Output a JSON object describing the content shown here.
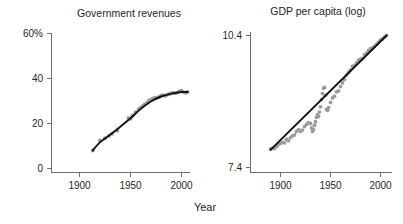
{
  "figure": {
    "width": 403,
    "height": 224,
    "background": "#ffffff",
    "shared_xlabel": "Year",
    "marker_color": "#9c9c9c",
    "trend_color": "#111111",
    "axis_color": "#6e6e6e"
  },
  "chart_data": [
    {
      "type": "scatter",
      "panel": "left",
      "title": "Government revenues",
      "xlabel": "Year",
      "ylabel": "",
      "grid": false,
      "legend": null,
      "xlim": [
        1885,
        2012
      ],
      "ylim": [
        0,
        63
      ],
      "xticks": [
        1900,
        1950,
        2000
      ],
      "xtick_labels": [
        "1900",
        "1950",
        "2000"
      ],
      "yticks": [
        0,
        20,
        40,
        60
      ],
      "ytick_labels": [
        "0",
        "20",
        "40",
        "60%"
      ],
      "series": [
        {
          "name": "Government revenues (% of GDP)",
          "role": "points",
          "color": "#9c9c9c",
          "x": [
            1913,
            1920,
            1925,
            1929,
            1932,
            1937,
            1948,
            1950,
            1952,
            1955,
            1958,
            1960,
            1962,
            1964,
            1966,
            1968,
            1970,
            1972,
            1974,
            1976,
            1978,
            1980,
            1982,
            1984,
            1986,
            1988,
            1990,
            1992,
            1994,
            1996,
            1998,
            2000,
            2002,
            2004,
            2006
          ],
          "y": [
            8.0,
            12.5,
            13.4,
            14.6,
            15.5,
            16.8,
            22.4,
            22.1,
            23.6,
            25.0,
            26.3,
            27.0,
            27.8,
            28.4,
            29.1,
            30.2,
            30.6,
            31.1,
            31.5,
            31.4,
            31.8,
            32.4,
            32.6,
            32.3,
            32.8,
            33.1,
            33.4,
            33.6,
            33.5,
            33.8,
            34.3,
            34.6,
            33.9,
            33.7,
            34.0
          ]
        },
        {
          "name": "Smoothed trend",
          "role": "fit",
          "color": "#111111",
          "x": [
            1913,
            1920,
            1930,
            1940,
            1950,
            1960,
            1970,
            1980,
            1990,
            2000,
            2006
          ],
          "y": [
            8.0,
            11.6,
            15.0,
            18.6,
            22.3,
            26.5,
            29.8,
            32.0,
            33.3,
            34.0,
            34.0
          ]
        }
      ]
    },
    {
      "type": "scatter",
      "panel": "right",
      "title": "GDP per capita (log)",
      "xlabel": "Year",
      "ylabel": "",
      "grid": false,
      "legend": null,
      "xlim": [
        1885,
        2012
      ],
      "ylim": [
        7.4,
        10.7
      ],
      "xticks": [
        1900,
        1950,
        2000
      ],
      "xtick_labels": [
        "1900",
        "1950",
        "2000"
      ],
      "yticks": [
        7.4,
        10.4
      ],
      "ytick_labels": [
        "7.4",
        "10.4"
      ],
      "series": [
        {
          "name": "GDP per capita (log)",
          "role": "points",
          "color": "#9c9c9c",
          "x": [
            1890,
            1892,
            1894,
            1896,
            1898,
            1900,
            1902,
            1904,
            1906,
            1908,
            1910,
            1912,
            1914,
            1916,
            1918,
            1920,
            1922,
            1924,
            1926,
            1928,
            1930,
            1931,
            1932,
            1933,
            1934,
            1935,
            1936,
            1937,
            1938,
            1939,
            1940,
            1941,
            1942,
            1943,
            1944,
            1945,
            1946,
            1947,
            1948,
            1950,
            1952,
            1954,
            1956,
            1958,
            1960,
            1962,
            1964,
            1966,
            1968,
            1970,
            1972,
            1974,
            1976,
            1978,
            1980,
            1982,
            1984,
            1986,
            1988,
            1990,
            1992,
            1994,
            1996,
            1998,
            2000,
            2002,
            2004,
            2006
          ],
          "y": [
            7.82,
            7.84,
            7.83,
            7.88,
            7.92,
            7.95,
            7.97,
            7.96,
            8.04,
            8.01,
            8.08,
            8.12,
            8.14,
            8.22,
            8.26,
            8.22,
            8.25,
            8.33,
            8.38,
            8.42,
            8.4,
            8.3,
            8.22,
            8.26,
            8.36,
            8.44,
            8.54,
            8.6,
            8.56,
            8.66,
            8.78,
            8.94,
            9.08,
            9.2,
            9.22,
            9.04,
            8.72,
            8.7,
            8.76,
            8.88,
            8.98,
            9.02,
            9.12,
            9.14,
            9.24,
            9.32,
            9.4,
            9.5,
            9.56,
            9.62,
            9.7,
            9.72,
            9.78,
            9.84,
            9.86,
            9.88,
            9.96,
            10.0,
            10.06,
            10.1,
            10.12,
            10.16,
            10.2,
            10.25,
            10.3,
            10.32,
            10.36,
            10.4
          ]
        },
        {
          "name": "Linear fit",
          "role": "fit",
          "color": "#111111",
          "x": [
            1890,
            2006
          ],
          "y": [
            7.8,
            10.4
          ]
        }
      ]
    }
  ]
}
